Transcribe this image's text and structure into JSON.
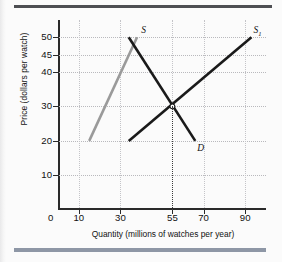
{
  "figure": {
    "type": "economics-supply-demand-graph"
  },
  "chart_data": {
    "type": "line",
    "title": "",
    "xlabel": "Quantity (millions of watches per year)",
    "ylabel": "Price (dollars per watch)",
    "xlim": [
      0,
      100
    ],
    "ylim": [
      0,
      55
    ],
    "grid": true,
    "legend_position": "inline-curve-labels",
    "xticks": [
      0,
      10,
      30,
      55,
      70,
      90
    ],
    "xtick_labels": [
      "0",
      "10",
      "30",
      "55",
      "70",
      "90"
    ],
    "yticks": [
      10,
      20,
      30,
      40,
      45,
      50
    ],
    "ytick_labels": [
      "10",
      "20",
      "30",
      "40",
      "45",
      "50"
    ],
    "gridlines_x": [
      10,
      30,
      55,
      70,
      90
    ],
    "gridlines_y": [
      10,
      20,
      30,
      40,
      45,
      50
    ],
    "series": [
      {
        "name": "S",
        "label": "S",
        "label_sub": "",
        "color": "#9a9a9a",
        "points": [
          [
            15,
            20
          ],
          [
            38,
            50
          ]
        ],
        "label_x": 40,
        "label_y": 52
      },
      {
        "name": "D",
        "label": "D",
        "label_sub": "",
        "color": "#1a1a1a",
        "points": [
          [
            34,
            50
          ],
          [
            66,
            20
          ]
        ],
        "label_x": 67,
        "label_y": 18
      },
      {
        "name": "S1",
        "label": "S",
        "label_sub": "1",
        "color": "#1a1a1a",
        "points": [
          [
            34,
            20
          ],
          [
            93,
            50
          ]
        ],
        "label_x": 94,
        "label_y": 52
      }
    ],
    "equilibrium": {
      "x": 55,
      "y": 30,
      "marker": "open-circle",
      "dropline_to_x_axis": true
    }
  },
  "decor": {
    "rule_top_color": "#4e4f53",
    "rule_bottom_color": "#8e97a6"
  }
}
